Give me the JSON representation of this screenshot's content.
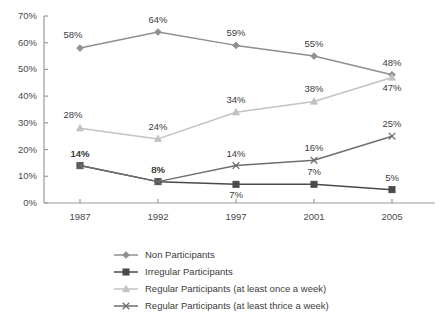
{
  "chart_data": {
    "type": "line",
    "title": "",
    "subtitle": "",
    "xlabel": "",
    "ylabel": "",
    "categories": [
      "1987",
      "1992",
      "1997",
      "2001",
      "2005"
    ],
    "x_tick_labels": [
      "1987",
      "1992",
      "1997",
      "2001",
      "2005"
    ],
    "y_tick_labels": [
      "0%",
      "10%",
      "20%",
      "30%",
      "40%",
      "50%",
      "60%",
      "70%"
    ],
    "y_tick_values": [
      0,
      10,
      20,
      30,
      40,
      50,
      60,
      70
    ],
    "ylim": [
      0,
      70
    ],
    "grid": false,
    "legend_position": "bottom",
    "value_suffix": "%",
    "series": [
      {
        "name": "Non Participants",
        "marker": "diamond-marker",
        "color": "#8f8f8f",
        "values": [
          58,
          64,
          59,
          55,
          48
        ],
        "labels": [
          "58%",
          "64%",
          "59%",
          "55%",
          "48%"
        ],
        "label_positions": [
          "above-left",
          "above",
          "above",
          "above",
          "above"
        ]
      },
      {
        "name": "Irregular Participants",
        "marker": "square-marker",
        "color": "#4a4a4a",
        "values": [
          14,
          8,
          7,
          7,
          5
        ],
        "labels": [
          "14%",
          "8%",
          "7%",
          "7%",
          "5%"
        ],
        "label_positions": [
          "above",
          "above",
          "below",
          "above",
          "above"
        ]
      },
      {
        "name": "Regular Participants (at least once a week)",
        "marker": "triangle-marker",
        "color": "#c2c2c2",
        "values": [
          28,
          24,
          34,
          38,
          47
        ],
        "labels": [
          "28%",
          "24%",
          "34%",
          "38%",
          "47%"
        ],
        "label_positions": [
          "above-left",
          "above",
          "above",
          "above",
          "below"
        ]
      },
      {
        "name": "Regular Participants (at least thrice a week)",
        "marker": "x-marker",
        "color": "#6e6e6e",
        "values": [
          14,
          8,
          14,
          16,
          25
        ],
        "labels": [
          "14%",
          "8%",
          "14%",
          "16%",
          "25%"
        ],
        "label_positions": [
          "above",
          "above",
          "above",
          "above",
          "above"
        ]
      }
    ]
  },
  "legend": {
    "items": [
      {
        "label": "Non Participants",
        "marker": "diamond-marker",
        "color": "#8f8f8f"
      },
      {
        "label": "Irregular Participants",
        "marker": "square-marker",
        "color": "#4a4a4a"
      },
      {
        "label": "Regular Participants (at least once a week)",
        "marker": "triangle-marker",
        "color": "#c2c2c2"
      },
      {
        "label": "Regular Participants (at least thrice a week)",
        "marker": "x-marker",
        "color": "#6e6e6e"
      }
    ]
  },
  "axis": {
    "line_color": "#9a9a9a",
    "tick_color": "#9a9a9a"
  },
  "geometry": {
    "plot_left": 44,
    "plot_right": 435,
    "plot_top": 16,
    "plot_bottom": 203,
    "x_positions": [
      80,
      158,
      236,
      314,
      392
    ]
  }
}
